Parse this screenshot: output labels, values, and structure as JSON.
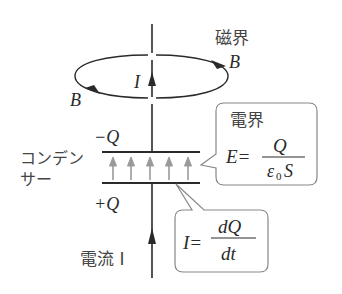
{
  "diagram": {
    "magnetic_field_label": "磁界",
    "b_label_right": "B",
    "b_label_left": "B",
    "current_label_top": "I",
    "minus_q": "−Q",
    "plus_q": "+Q",
    "capacitor_label_line1": "コンデン",
    "capacitor_label_line2": "サー",
    "current_label_bottom": "電流 I",
    "electric_field_box": {
      "title": "電界",
      "lhs": "E=",
      "numerator": "Q",
      "denominator_eps": "ε",
      "denominator_sub": "0",
      "denominator_s": "S"
    },
    "current_box": {
      "lhs": "I=",
      "numerator": "dQ",
      "denominator": "dt"
    },
    "colors": {
      "line": "#2a2a2a",
      "field_arrow": "#9a9a9a",
      "box_border": "#888888"
    }
  }
}
